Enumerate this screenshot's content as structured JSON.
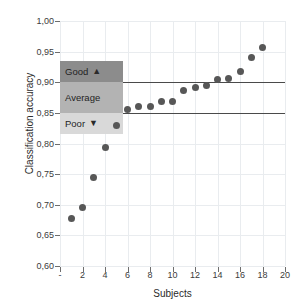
{
  "chart_data": {
    "type": "scatter",
    "title": "",
    "xlabel": "Subjects",
    "ylabel": "Classification accuracy",
    "xlim": [
      0,
      20
    ],
    "ylim": [
      0.6,
      1.0
    ],
    "grid": true,
    "legend_position": "inside-left",
    "x": [
      1,
      2,
      3,
      4,
      5,
      6,
      7,
      8,
      9,
      10,
      11,
      12,
      13,
      14,
      15,
      16,
      17,
      18
    ],
    "values": [
      0.677,
      0.696,
      0.744,
      0.793,
      0.83,
      0.856,
      0.86,
      0.861,
      0.868,
      0.869,
      0.887,
      0.892,
      0.894,
      0.905,
      0.906,
      0.917,
      0.94,
      0.957
    ],
    "series": [
      {
        "name": "Classification accuracy",
        "marker": "circle",
        "color": "#575757",
        "values": [
          0.677,
          0.696,
          0.744,
          0.793,
          0.83,
          0.856,
          0.86,
          0.861,
          0.868,
          0.869,
          0.887,
          0.892,
          0.894,
          0.905,
          0.906,
          0.917,
          0.94,
          0.957
        ]
      }
    ],
    "y_ticks": [
      "0,60",
      "0,65",
      "0,70",
      "0,75",
      "0,80",
      "0,85",
      "0,90",
      "0,95",
      "1,00"
    ],
    "y_tick_values": [
      0.6,
      0.65,
      0.7,
      0.75,
      0.8,
      0.85,
      0.9,
      0.95,
      1.0
    ],
    "x_ticks": [
      "-",
      "2",
      "4",
      "6",
      "8",
      "10",
      "12",
      "14",
      "16",
      "18",
      "20"
    ],
    "x_tick_values": [
      0,
      2,
      4,
      6,
      8,
      10,
      12,
      14,
      16,
      18,
      20
    ],
    "threshold_lines": [
      {
        "value": 0.9,
        "color": "#4a4a4a"
      },
      {
        "value": 0.85,
        "color": "#4a4a4a"
      }
    ],
    "bands": [
      {
        "label": "Good",
        "symbol": "▲",
        "from": 0.9,
        "to": 0.935,
        "color": "#8c8c8c"
      },
      {
        "label": "Average",
        "symbol": "",
        "from": 0.85,
        "to": 0.9,
        "color": "#b3b3b3"
      },
      {
        "label": "Poor",
        "symbol": "▼",
        "from": 0.815,
        "to": 0.85,
        "color": "#d9d9d9"
      }
    ],
    "annotations": []
  },
  "colors": {
    "marker": "#575757",
    "threshold": "#4a4a4a",
    "grid": "#e9ecef",
    "axis": "#6d6d6d",
    "band_good": "#8c8c8c",
    "band_average": "#b3b3b3",
    "band_poor": "#d9d9d9",
    "background": "#ffffff"
  }
}
